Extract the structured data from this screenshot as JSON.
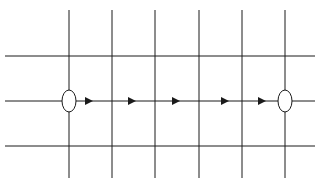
{
  "diagram": {
    "width": 317,
    "height": 183,
    "background": "#ffffff",
    "stroke_color": "#1a1a1a",
    "vertical_lines": [
      {
        "x": 69,
        "y1": 10,
        "y2": 178
      },
      {
        "x": 112,
        "y1": 10,
        "y2": 178
      },
      {
        "x": 155,
        "y1": 10,
        "y2": 178
      },
      {
        "x": 199,
        "y1": 10,
        "y2": 178
      },
      {
        "x": 242,
        "y1": 10,
        "y2": 178
      },
      {
        "x": 285,
        "y1": 10,
        "y2": 178
      }
    ],
    "horizontal_lines": [
      {
        "y": 56,
        "x1": 5,
        "x2": 315
      },
      {
        "y": 101,
        "x1": 5,
        "x2": 315
      },
      {
        "y": 146,
        "x1": 5,
        "x2": 315
      }
    ],
    "nodes": [
      {
        "name": "start-node",
        "cx": 69,
        "cy": 101,
        "rx": 7,
        "ry": 11
      },
      {
        "name": "end-node",
        "cx": 285,
        "cy": 101,
        "rx": 7,
        "ry": 11
      }
    ],
    "arrows": [
      {
        "x": 89,
        "y": 101
      },
      {
        "x": 132,
        "y": 101
      },
      {
        "x": 176,
        "y": 101
      },
      {
        "x": 225,
        "y": 101
      },
      {
        "x": 262,
        "y": 101
      }
    ]
  }
}
